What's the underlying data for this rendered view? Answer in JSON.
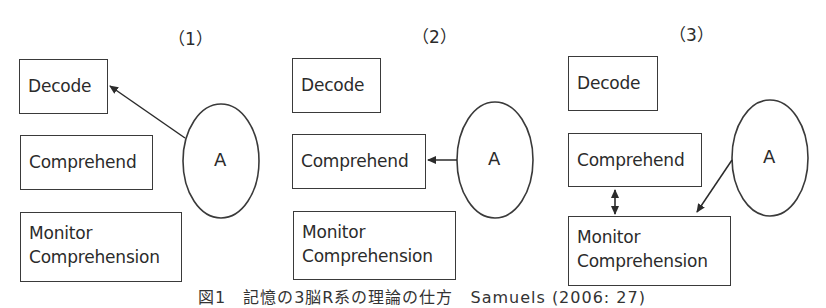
{
  "figure": {
    "caption": "図1　記憶の3脳R系の理論の仕方　Samuels (2006: 27)",
    "colors": {
      "stroke": "#3a3a3a",
      "text": "#2b2b2b",
      "background": "#ffffff"
    },
    "panels": [
      {
        "label": "（1）",
        "boxes": {
          "decode": "Decode",
          "comprehend": "Comprehend",
          "monitor_line1": "Monitor",
          "monitor_line2": "Comprehension"
        },
        "ellipse_label": "A",
        "arrows": [
          {
            "from": "A",
            "to": "Decode",
            "type": "single"
          }
        ]
      },
      {
        "label": "（2）",
        "boxes": {
          "decode": "Decode",
          "comprehend": "Comprehend",
          "monitor_line1": "Monitor",
          "monitor_line2": "Comprehension"
        },
        "ellipse_label": "A",
        "arrows": [
          {
            "from": "A",
            "to": "Comprehend",
            "type": "single"
          }
        ]
      },
      {
        "label": "（3）",
        "boxes": {
          "decode": "Decode",
          "comprehend": "Comprehend",
          "monitor_line1": "Monitor",
          "monitor_line2": "Comprehension"
        },
        "ellipse_label": "A",
        "arrows": [
          {
            "from": "A",
            "to": "Monitor Comprehension",
            "type": "single"
          },
          {
            "from": "Comprehend",
            "to": "Monitor Comprehension",
            "type": "double"
          }
        ]
      }
    ]
  }
}
